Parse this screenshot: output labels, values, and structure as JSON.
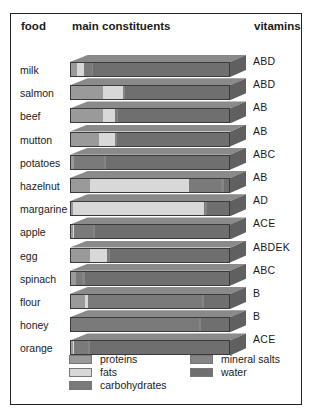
{
  "header": {
    "food": "food",
    "main_constituents": "main constituents",
    "vitamins": "vitamins"
  },
  "colors": {
    "proteins": "#9a9a9a",
    "fats": "#d8d8d8",
    "carbohydrates": "#7a7a7a",
    "mineral_salts": "#858585",
    "water": "#6f6f6f",
    "bar_top": "#8a8a8a",
    "bar_side": "#606060"
  },
  "legend": {
    "proteins": "proteins",
    "fats": "fats",
    "carbohydrates": "carbohydrates",
    "mineral_salts": "mineral salts",
    "water": "water"
  },
  "chart_data": {
    "type": "bar",
    "orientation": "horizontal-stacked-100%",
    "title": "",
    "xlabel": "main constituents",
    "ylabel": "food",
    "categories": [
      "milk",
      "salmon",
      "beef",
      "mutton",
      "potatoes",
      "hazelnut",
      "margarine",
      "apple",
      "egg",
      "spinach",
      "flour",
      "honey",
      "orange"
    ],
    "series": [
      {
        "name": "proteins",
        "values": [
          4,
          20,
          20,
          18,
          2,
          12,
          1,
          1,
          12,
          3,
          9,
          0,
          1
        ]
      },
      {
        "name": "fats",
        "values": [
          4,
          13,
          8,
          10,
          0,
          63,
          83,
          1,
          11,
          0,
          2,
          0,
          1
        ]
      },
      {
        "name": "carbohydrates",
        "values": [
          5,
          0,
          1,
          0,
          19,
          20,
          1,
          12,
          1,
          4,
          72,
          81,
          9
        ]
      },
      {
        "name": "mineral_salts",
        "values": [
          1,
          1,
          1,
          1,
          1,
          2,
          1,
          1,
          1,
          2,
          1,
          1,
          1
        ]
      },
      {
        "name": "water",
        "values": [
          86,
          66,
          70,
          71,
          78,
          3,
          14,
          85,
          75,
          91,
          16,
          18,
          88
        ]
      }
    ],
    "vitamins": [
      "ABD",
      "ABD",
      "AB",
      "AB",
      "ABC",
      "AB",
      "AD",
      "ACE",
      "ABDEK",
      "ABC",
      "B",
      "B",
      "ACE"
    ],
    "legend_position": "bottom",
    "grid": false,
    "xlim": [
      0,
      100
    ]
  }
}
